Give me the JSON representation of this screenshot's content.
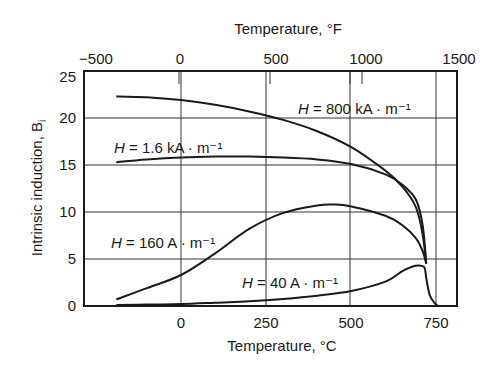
{
  "chart_data": {
    "type": "line",
    "title": "",
    "xlabel": "Temperature, °C",
    "x2label": "Temperature, °F",
    "ylabel": "Intrinsic induction, B",
    "ylabel_subscript": "i",
    "xlim": [
      -296,
      816
    ],
    "ylim": [
      0,
      25
    ],
    "x_ticks": [
      "0",
      "250",
      "500",
      "750"
    ],
    "x2_ticks": [
      "−500",
      "0",
      "500",
      "1000",
      "1500"
    ],
    "y_ticks": [
      "0",
      "5",
      "10",
      "15",
      "20",
      "25"
    ],
    "grid": true,
    "series": [
      {
        "name": "H = 800 kA · m⁻¹",
        "x": [
          -190,
          -100,
          0,
          100,
          200,
          300,
          400,
          500,
          600,
          650,
          690,
          710,
          720
        ],
        "y": [
          22.3,
          22.2,
          21.9,
          21.4,
          20.7,
          19.8,
          18.6,
          16.9,
          14.4,
          12.7,
          10.5,
          7.5,
          4.5
        ]
      },
      {
        "name": "H = 1.6 kA · m⁻¹",
        "x": [
          -190,
          -100,
          0,
          100,
          200,
          300,
          400,
          500,
          600,
          650,
          690,
          710,
          720
        ],
        "y": [
          15.3,
          15.6,
          15.8,
          15.9,
          15.9,
          15.8,
          15.6,
          15.1,
          14.0,
          12.9,
          11.3,
          8.5,
          4.5
        ]
      },
      {
        "name": "H = 160 A · m⁻¹",
        "x": [
          -190,
          -100,
          0,
          100,
          200,
          300,
          400,
          450,
          500,
          600,
          650,
          690,
          710,
          720
        ],
        "y": [
          0.7,
          1.9,
          3.3,
          5.6,
          8.2,
          9.9,
          10.7,
          10.8,
          10.6,
          9.6,
          8.6,
          7.2,
          5.8,
          4.5
        ]
      },
      {
        "name": "H = 40 A · m⁻¹",
        "x": [
          -190,
          -100,
          0,
          100,
          200,
          300,
          400,
          500,
          600,
          650,
          680,
          700,
          715,
          720,
          730,
          745,
          755
        ],
        "y": [
          0.1,
          0.15,
          0.2,
          0.35,
          0.5,
          0.75,
          1.1,
          1.6,
          2.6,
          3.7,
          4.2,
          4.3,
          4.1,
          3.0,
          1.2,
          0.3,
          0
        ]
      }
    ],
    "annotations": [
      {
        "text": "H = 800 kA · m⁻¹",
        "near": "upper right"
      },
      {
        "text": "H = 1.6 kA · m⁻¹",
        "near": "upper left above 15"
      },
      {
        "text": "H = 160 A · m⁻¹",
        "near": "left middle"
      },
      {
        "text": "H = 40 A · m⁻¹",
        "near": "lower middle"
      }
    ]
  },
  "labels": {
    "top_axis": "Temperature, °F",
    "bottom_axis": "Temperature, °C",
    "y_axis": "Intrinsic induction, B",
    "y_axis_sub": "i",
    "h800_pre": "H",
    "h800_post": " = 800 kA · m⁻¹",
    "h16_pre": "H",
    "h16_post": " = 1.6 kA · m⁻¹",
    "h160_pre": "H",
    "h160_post": " = 160 A · m⁻¹",
    "h40_pre": "H",
    "h40_post": " = 40 A · m⁻¹"
  }
}
